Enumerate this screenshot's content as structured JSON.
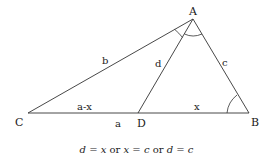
{
  "diagram": {
    "vertices": [
      {
        "name": "A",
        "x": 193,
        "y": 19,
        "label_x": 193,
        "label_y": 13
      },
      {
        "name": "B",
        "x": 249,
        "y": 113,
        "label_x": 255,
        "label_y": 125
      },
      {
        "name": "C",
        "x": 28,
        "y": 113,
        "label_x": 20,
        "label_y": 125
      },
      {
        "name": "D",
        "x": 138,
        "y": 113,
        "label_x": 141,
        "label_y": 126
      }
    ],
    "segments": [
      {
        "from": "A",
        "to": "C",
        "label": "b"
      },
      {
        "from": "A",
        "to": "B",
        "label": "c"
      },
      {
        "from": "A",
        "to": "D",
        "label": "d"
      },
      {
        "from": "C",
        "to": "D",
        "label": "a-x"
      },
      {
        "from": "D",
        "to": "B",
        "label": "x"
      },
      {
        "from": "C",
        "to": "B",
        "label": "a"
      }
    ],
    "angle_marks": [
      "angle CAD at A",
      "angle DAB at A",
      "angle ABD at B"
    ],
    "caption": {
      "part1_var": "d",
      "eq1": " = ",
      "part1_rhs": "x",
      "or1": " or ",
      "part2_var": "x",
      "eq2": " = ",
      "part2_rhs": "c",
      "or2": " or ",
      "part3_var": "d",
      "eq3": " = ",
      "part3_rhs": "c"
    },
    "colors": {
      "line": "#333333",
      "text": "#1a1a1a",
      "background": "#ffffff"
    }
  }
}
